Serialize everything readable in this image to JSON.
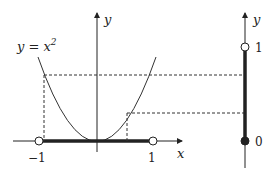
{
  "diagram": {
    "curve_label": "y = x",
    "curve_label_exp": "2",
    "left_plot": {
      "x_axis_label": "x",
      "y_axis_label": "y",
      "tick_labels": {
        "neg_one": "−1",
        "one": "1"
      },
      "domain": {
        "from": -1,
        "to": 1,
        "endpoints": "open"
      }
    },
    "right_plot": {
      "y_axis_label": "y",
      "tick_labels": {
        "one": "1",
        "zero": "0"
      },
      "range": {
        "from": 0,
        "to": 1,
        "lower": "closed",
        "upper": "open"
      }
    },
    "colors": {
      "ink": "#222222",
      "background": "#ffffff"
    }
  }
}
